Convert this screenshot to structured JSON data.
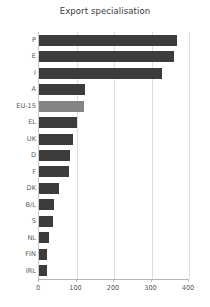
{
  "chart_data": {
    "type": "bar",
    "orientation": "horizontal",
    "title": "Export specialisation",
    "xlabel": "",
    "ylabel": "",
    "categories": [
      "P",
      "E",
      "I",
      "A",
      "EU-15",
      "EL",
      "UK",
      "D",
      "F",
      "DK",
      "B/L",
      "S",
      "NL",
      "FIN",
      "IRL"
    ],
    "values": [
      368,
      360,
      328,
      123,
      120,
      101,
      90,
      83,
      80,
      53,
      40,
      37,
      27,
      22,
      21
    ],
    "xlim": [
      0,
      400
    ],
    "xticks": [
      0,
      100,
      200,
      300,
      400
    ],
    "xtick_labels": [
      "0",
      "100",
      "200",
      "300",
      "400"
    ],
    "grid": true,
    "legend": "none",
    "highlight_category": "EU-15",
    "colors": {
      "bar": "#3c3c3c",
      "highlight_bar": "#848484",
      "grid": "#dcdcdc",
      "axis": "#b5b5b5",
      "text": "#5a5a5a",
      "title_text": "#3b3b3b",
      "background": "#ffffff"
    }
  }
}
